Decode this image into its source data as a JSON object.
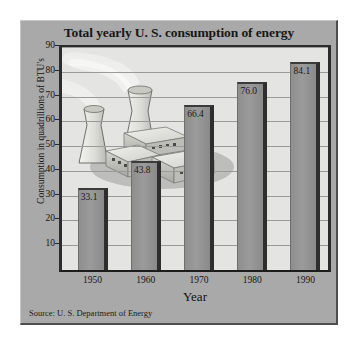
{
  "chart_data": {
    "type": "bar",
    "title": "Total yearly U. S. consumption of energy",
    "xlabel": "Year",
    "ylabel": "Consumption in quadrillions of BTU's",
    "categories": [
      "1950",
      "1960",
      "1970",
      "1980",
      "1990"
    ],
    "values": [
      33.1,
      43.8,
      66.4,
      76.0,
      84.1
    ],
    "value_labels": [
      "33.1",
      "43.8",
      "66.4",
      "76.0",
      "84.1"
    ],
    "ylim": [
      0,
      90
    ],
    "ytick_labels": [
      "90",
      "80",
      "70",
      "60",
      "50",
      "40",
      "30",
      "20",
      "10"
    ],
    "ytick_values": [
      90,
      80,
      70,
      60,
      50,
      40,
      30,
      20,
      10
    ],
    "grid": true,
    "legend": "none",
    "source": "Source: U. S. Department of Energy",
    "colors": {
      "panel_background": "#a9a9a9",
      "plot_background": "#e4e4e2",
      "bar_fill": "#9b9b9b",
      "bar_shadow": "#2e2e2e",
      "gridline": "#9a9a98",
      "axis": "#2c2c2c",
      "text": "#141414"
    },
    "illustration": {
      "name": "power-plant-illustration",
      "description": "Nuclear power plant with two cooling towers emitting steam plumes and low rectangular buildings"
    }
  }
}
